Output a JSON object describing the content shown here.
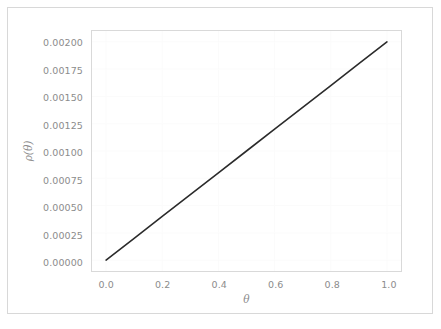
{
  "figure": {
    "background_color": "#ffffff",
    "frame_color": "#d8d8d8",
    "axes_spine_color": "#d9d9d9",
    "grid_color": "#fbfbfb",
    "tick_label_color": "#8c8c8c"
  },
  "chart_data": {
    "type": "line",
    "title": "",
    "xlabel": "θ",
    "ylabel": "ρ(θ)",
    "xlim": [
      -0.05,
      1.05
    ],
    "ylim": [
      -0.0001,
      0.0021
    ],
    "grid": true,
    "legend": null,
    "line_color": "#2b2b2b",
    "line_width": 1.6,
    "xticks": [
      0.0,
      0.2,
      0.4,
      0.6,
      0.8,
      1.0
    ],
    "xticklabels": [
      "0.0",
      "0.2",
      "0.4",
      "0.6",
      "0.8",
      "1.0"
    ],
    "yticks": [
      0.0,
      0.00025,
      0.0005,
      0.00075,
      0.001,
      0.00125,
      0.0015,
      0.00175,
      0.002
    ],
    "yticklabels": [
      "0.00000",
      "0.00025",
      "0.00050",
      "0.00075",
      "0.00100",
      "0.00125",
      "0.00150",
      "0.00175",
      "0.00200"
    ],
    "series": [
      {
        "name": "rho",
        "x": [
          0.0,
          0.1,
          0.2,
          0.3,
          0.4,
          0.5,
          0.6,
          0.7,
          0.8,
          0.9,
          1.0
        ],
        "values": [
          0.0,
          0.0002,
          0.0004,
          0.0006,
          0.0008,
          0.001,
          0.0012,
          0.0014,
          0.0016,
          0.0018,
          0.002
        ]
      }
    ]
  }
}
